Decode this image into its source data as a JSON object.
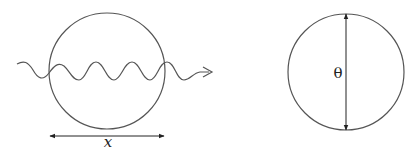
{
  "diagram": {
    "panels": [
      {
        "id": "left",
        "shape": "circle",
        "wave": "sinusoidal wave passing horizontally through circle with arrowhead on right",
        "dimension_arrow": "horizontal double-headed arrow below circle spanning its diameter",
        "label": "x"
      },
      {
        "id": "right",
        "shape": "circle",
        "dimension_arrow": "vertical double-headed arrow spanning circle diameter",
        "label": "θ"
      }
    ],
    "colors": {
      "stroke": "#555555",
      "text": "#222222",
      "background": "#ffffff"
    }
  }
}
